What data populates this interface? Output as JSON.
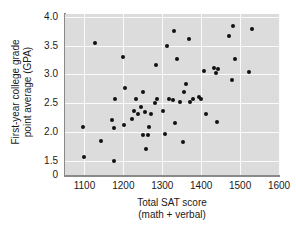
{
  "chart_data": {
    "type": "scatter",
    "title": "",
    "xlabel": "Total SAT score",
    "xlabel_sub": "(math + verbal)",
    "ylabel_line1": "First-year college grade",
    "ylabel_line2": "point average (GPA)",
    "xlim": [
      1050,
      1600
    ],
    "ylim": [
      1.25,
      4.05
    ],
    "xticks": [
      "1100",
      "1200",
      "1300",
      "1400",
      "1500",
      "1600"
    ],
    "xtick_values": [
      1100,
      1200,
      1300,
      1400,
      1500,
      1600
    ],
    "yticks": [
      "4.0",
      "3.5",
      "3.0",
      "2.5",
      "2.0",
      "1.5",
      "0"
    ],
    "ytick_values": [
      4.0,
      3.5,
      3.0,
      2.5,
      2.0,
      1.5,
      1.25
    ],
    "grid": true,
    "legend": "none",
    "plot_background": "#dcdcdc",
    "gridline_color": "#fbfbfb",
    "point_color": "#111111",
    "axis_color": "#8a8a8a",
    "n_points": 55,
    "points": [
      {
        "x": 1098,
        "y": 1.57
      },
      {
        "x": 1097,
        "y": 2.08
      },
      {
        "x": 1128,
        "y": 3.54
      },
      {
        "x": 1143,
        "y": 1.84
      },
      {
        "x": 1170,
        "y": 2.2
      },
      {
        "x": 1175,
        "y": 1.49
      },
      {
        "x": 1177,
        "y": 2.07
      },
      {
        "x": 1178,
        "y": 2.57
      },
      {
        "x": 1200,
        "y": 3.31
      },
      {
        "x": 1202,
        "y": 2.12
      },
      {
        "x": 1205,
        "y": 2.76
      },
      {
        "x": 1222,
        "y": 2.23
      },
      {
        "x": 1228,
        "y": 2.37
      },
      {
        "x": 1232,
        "y": 2.58
      },
      {
        "x": 1237,
        "y": 2.32
      },
      {
        "x": 1245,
        "y": 2.44
      },
      {
        "x": 1250,
        "y": 1.95
      },
      {
        "x": 1251,
        "y": 2.69
      },
      {
        "x": 1255,
        "y": 2.35
      },
      {
        "x": 1258,
        "y": 1.71
      },
      {
        "x": 1262,
        "y": 1.95
      },
      {
        "x": 1272,
        "y": 2.31
      },
      {
        "x": 1280,
        "y": 2.5
      },
      {
        "x": 1283,
        "y": 3.16
      },
      {
        "x": 1287,
        "y": 2.58
      },
      {
        "x": 1302,
        "y": 2.37
      },
      {
        "x": 1308,
        "y": 1.97
      },
      {
        "x": 1312,
        "y": 3.5
      },
      {
        "x": 1318,
        "y": 2.57
      },
      {
        "x": 1327,
        "y": 2.55
      },
      {
        "x": 1330,
        "y": 3.76
      },
      {
        "x": 1333,
        "y": 2.15
      },
      {
        "x": 1338,
        "y": 3.26
      },
      {
        "x": 1345,
        "y": 2.52
      },
      {
        "x": 1352,
        "y": 1.82
      },
      {
        "x": 1355,
        "y": 2.7
      },
      {
        "x": 1362,
        "y": 2.84
      },
      {
        "x": 1368,
        "y": 3.61
      },
      {
        "x": 1372,
        "y": 2.52
      },
      {
        "x": 1378,
        "y": 2.57
      },
      {
        "x": 1395,
        "y": 2.61
      },
      {
        "x": 1400,
        "y": 2.58
      },
      {
        "x": 1408,
        "y": 3.06
      },
      {
        "x": 1412,
        "y": 2.32
      },
      {
        "x": 1432,
        "y": 3.11
      },
      {
        "x": 1438,
        "y": 3.02
      },
      {
        "x": 1441,
        "y": 2.17
      },
      {
        "x": 1443,
        "y": 3.09
      },
      {
        "x": 1472,
        "y": 3.67
      },
      {
        "x": 1478,
        "y": 2.91
      },
      {
        "x": 1482,
        "y": 3.84
      },
      {
        "x": 1486,
        "y": 3.26
      },
      {
        "x": 1522,
        "y": 3.05
      },
      {
        "x": 1530,
        "y": 3.79
      },
      {
        "x": 1265,
        "y": 2.09
      }
    ]
  }
}
